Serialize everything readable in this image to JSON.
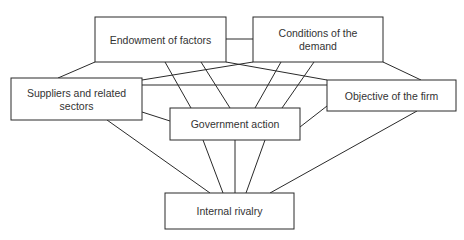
{
  "diagram": {
    "type": "network",
    "nodes": [
      {
        "id": "endowment",
        "lines": [
          "Endowment of factors"
        ]
      },
      {
        "id": "demand",
        "lines": [
          "Conditions of the",
          "demand"
        ]
      },
      {
        "id": "suppliers",
        "lines": [
          "Suppliers and related",
          "sectors"
        ]
      },
      {
        "id": "objective",
        "lines": [
          "Objective of the firm"
        ]
      },
      {
        "id": "government",
        "lines": [
          "Government action"
        ]
      },
      {
        "id": "rivalry",
        "lines": [
          "Internal rivalry"
        ]
      }
    ],
    "edges": [
      [
        "endowment",
        "demand"
      ],
      [
        "endowment",
        "suppliers"
      ],
      [
        "endowment",
        "objective"
      ],
      [
        "endowment",
        "government"
      ],
      [
        "endowment",
        "government"
      ],
      [
        "demand",
        "suppliers"
      ],
      [
        "demand",
        "objective"
      ],
      [
        "demand",
        "government"
      ],
      [
        "demand",
        "government"
      ],
      [
        "suppliers",
        "objective"
      ],
      [
        "suppliers",
        "government"
      ],
      [
        "suppliers",
        "rivalry"
      ],
      [
        "objective",
        "government"
      ],
      [
        "objective",
        "rivalry"
      ],
      [
        "government",
        "rivalry"
      ],
      [
        "government",
        "rivalry"
      ],
      [
        "government",
        "rivalry"
      ]
    ]
  }
}
